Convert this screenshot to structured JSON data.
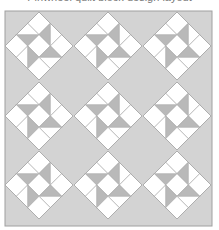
{
  "caption": "Pinwheel quilt block design layout",
  "quilt": {
    "rows": 3,
    "cols": 3,
    "frame": {
      "x": 5,
      "y": 11,
      "width": 207,
      "height": 215
    },
    "block_centers_x": [
      39,
      108,
      177
    ],
    "block_centers_y": [
      46,
      116,
      185
    ],
    "block_half_diagonal": 34,
    "colors": {
      "background": "#d3d3d3",
      "frame_stroke": "#a0a0a0",
      "white_patch": "#ffffff",
      "gray_patch": "#b9b9b9",
      "seam": "#a8a8a8"
    }
  }
}
